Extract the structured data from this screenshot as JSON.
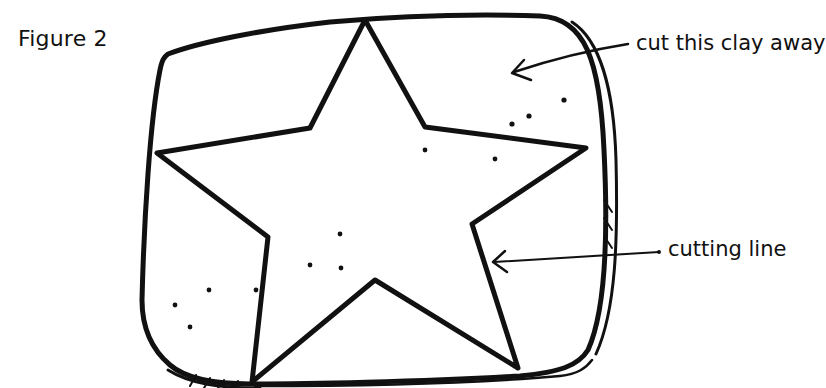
{
  "figure": {
    "label": "Figure 2"
  },
  "annotations": [
    {
      "id": "cut-away",
      "text": "cut this clay away",
      "points_to": "clay outside the star"
    },
    {
      "id": "cutting-line",
      "text": "cutting line",
      "points_to": "star outline"
    }
  ],
  "colors": {
    "ink": "#111111",
    "background": "#ffffff"
  }
}
